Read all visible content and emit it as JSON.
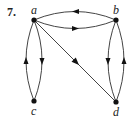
{
  "problem_number": "7.",
  "graph": {
    "type": "directed",
    "nodes": [
      {
        "id": "a",
        "label": "a",
        "x": 34,
        "y": 20
      },
      {
        "id": "b",
        "label": "b",
        "x": 116,
        "y": 20
      },
      {
        "id": "c",
        "label": "c",
        "x": 34,
        "y": 101
      },
      {
        "id": "d",
        "label": "d",
        "x": 116,
        "y": 102
      }
    ],
    "edges": [
      {
        "from": "b",
        "to": "a",
        "shape": "curve-upper"
      },
      {
        "from": "a",
        "to": "b",
        "shape": "curve-lower"
      },
      {
        "from": "c",
        "to": "a",
        "shape": "curve-outer-left"
      },
      {
        "from": "a",
        "to": "c",
        "shape": "curve-inner-right"
      },
      {
        "from": "b",
        "to": "d",
        "shape": "curve-inner-left"
      },
      {
        "from": "d",
        "to": "b",
        "shape": "curve-outer-right"
      },
      {
        "from": "a",
        "to": "d",
        "shape": "straight"
      }
    ]
  },
  "colors": {
    "stroke": "#444444",
    "node": "#111111",
    "background": "#ffffff"
  }
}
